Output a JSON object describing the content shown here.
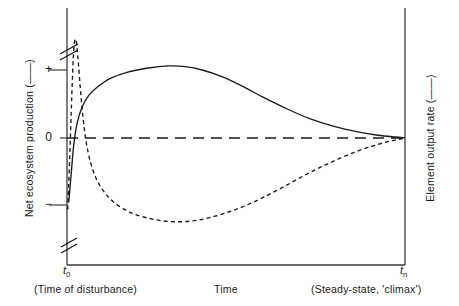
{
  "chart_data": {
    "type": "line",
    "title": "",
    "xlabel": "Time",
    "ylabel_left": "Net ecosystem production (——)",
    "ylabel_right": "Element output rate (– – –)",
    "x_tick_labels": [
      "t₀",
      "tₙ"
    ],
    "x_range_labels": [
      "(Time of disturbance)",
      "(Steady-state, 'climax')"
    ],
    "y_tick_labels": [
      "+",
      "0",
      "−"
    ],
    "ylim": [
      "−",
      "+"
    ],
    "grid": false,
    "legend_position": "axis-labels",
    "zero_line": true,
    "axis_break": true,
    "series": [
      {
        "name": "Net ecosystem production",
        "style": "solid",
        "points": [
          [
            0.005,
            -0.95
          ],
          [
            0.012,
            -0.55
          ],
          [
            0.02,
            -0.1
          ],
          [
            0.03,
            0.22
          ],
          [
            0.045,
            0.46
          ],
          [
            0.065,
            0.63
          ],
          [
            0.09,
            0.75
          ],
          [
            0.13,
            0.88
          ],
          [
            0.18,
            0.97
          ],
          [
            0.24,
            1.03
          ],
          [
            0.3,
            1.06
          ],
          [
            0.35,
            1.05
          ],
          [
            0.4,
            1.0
          ],
          [
            0.46,
            0.9
          ],
          [
            0.52,
            0.76
          ],
          [
            0.58,
            0.6
          ],
          [
            0.65,
            0.43
          ],
          [
            0.72,
            0.28
          ],
          [
            0.79,
            0.17
          ],
          [
            0.86,
            0.09
          ],
          [
            0.92,
            0.04
          ],
          [
            0.97,
            0.015
          ],
          [
            1.0,
            0.005
          ]
        ]
      },
      {
        "name": "Element output rate",
        "style": "dashed",
        "points": [
          [
            0.002,
            -1.05
          ],
          [
            0.008,
            -0.3
          ],
          [
            0.014,
            0.6
          ],
          [
            0.02,
            1.3
          ],
          [
            0.026,
            1.45
          ],
          [
            0.032,
            1.2
          ],
          [
            0.04,
            0.7
          ],
          [
            0.05,
            0.18
          ],
          [
            0.062,
            -0.2
          ],
          [
            0.08,
            -0.52
          ],
          [
            0.105,
            -0.76
          ],
          [
            0.14,
            -0.95
          ],
          [
            0.19,
            -1.1
          ],
          [
            0.25,
            -1.19
          ],
          [
            0.31,
            -1.23
          ],
          [
            0.37,
            -1.22
          ],
          [
            0.43,
            -1.16
          ],
          [
            0.5,
            -1.05
          ],
          [
            0.57,
            -0.9
          ],
          [
            0.64,
            -0.72
          ],
          [
            0.71,
            -0.53
          ],
          [
            0.78,
            -0.36
          ],
          [
            0.85,
            -0.21
          ],
          [
            0.91,
            -0.11
          ],
          [
            0.96,
            -0.04
          ],
          [
            1.0,
            -0.005
          ]
        ]
      }
    ],
    "colors": {
      "line": "#1a1a1a",
      "axis": "#3a3a3a",
      "background": "#ffffff"
    }
  },
  "axes": {
    "left_title": "Net ecosystem production (——)",
    "right_title": "Element output rate (——)",
    "x_title": "Time",
    "ticks": {
      "plus": "+",
      "zero": "0",
      "minus": "−"
    }
  },
  "x_axis": {
    "t_zero": "t",
    "t_zero_sub": "0",
    "t_n": "t",
    "t_n_sub": "n",
    "left_caption": "(Time of disturbance)",
    "center_caption": "Time",
    "right_caption": "(Steady-state, 'climax')"
  }
}
